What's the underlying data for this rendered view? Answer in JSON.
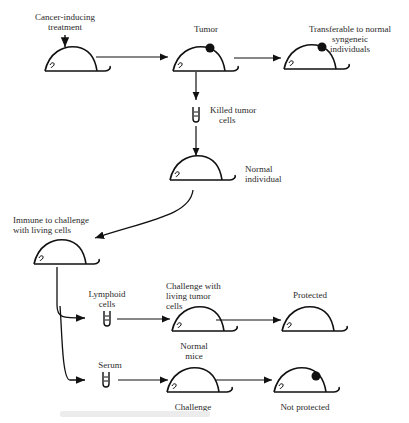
{
  "labels": {
    "cancer_treatment": [
      "Cancer-inducing",
      "treatment"
    ],
    "tumor": "Tumor",
    "transferable": [
      "Transferable to normal",
      "syngeneic",
      "individuals"
    ],
    "killed_cells": [
      "Killed tumor",
      "cells"
    ],
    "normal_individual": [
      "Normal",
      "individual"
    ],
    "immune": [
      "Immune to challenge",
      "with living cells"
    ],
    "lymphoid": [
      "Lymphoid",
      "cells"
    ],
    "challenge_living": [
      "Challenge with",
      "living tumor",
      "cells"
    ],
    "normal_mice": [
      "Normal",
      "mice"
    ],
    "protected": "Protected",
    "serum": "Serum",
    "challenge": "Challenge",
    "not_protected": "Not protected"
  },
  "colors": {
    "ink": "#111111",
    "text": "#2a2a2a",
    "background": "#ffffff"
  }
}
